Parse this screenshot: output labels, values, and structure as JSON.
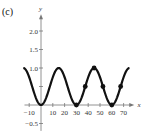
{
  "panel_label": "(c)",
  "chart_data": {
    "type": "line",
    "title": "",
    "xlabel": "x",
    "ylabel": "y",
    "xlim": [
      -15,
      77
    ],
    "ylim": [
      -0.7,
      2.4
    ],
    "x_ticks": [
      -10,
      10,
      20,
      30,
      40,
      50,
      60,
      70
    ],
    "x_tick_labels": [
      "−10",
      "10",
      "20",
      "30",
      "40",
      "50",
      "60",
      "70"
    ],
    "y_ticks": [
      -0.5,
      0.5,
      1.0,
      1.5,
      2.0
    ],
    "y_tick_labels": [
      "−0.5",
      "",
      "1.0",
      "1.5",
      "2.0"
    ],
    "grid": false,
    "series": [
      {
        "name": "y = (1 − cos(πx/15)) / 2",
        "function": "0.5 - 0.5*cos(pi*x/15)",
        "x_range": [
          -15,
          75
        ],
        "color": "#111111"
      }
    ],
    "points": [
      {
        "x": 30,
        "y": 0
      },
      {
        "x": 37.5,
        "y": 0.5
      },
      {
        "x": 45,
        "y": 1
      },
      {
        "x": 52.5,
        "y": 0.5
      },
      {
        "x": 60,
        "y": 0
      },
      {
        "x": 67.5,
        "y": 0.5
      }
    ]
  }
}
